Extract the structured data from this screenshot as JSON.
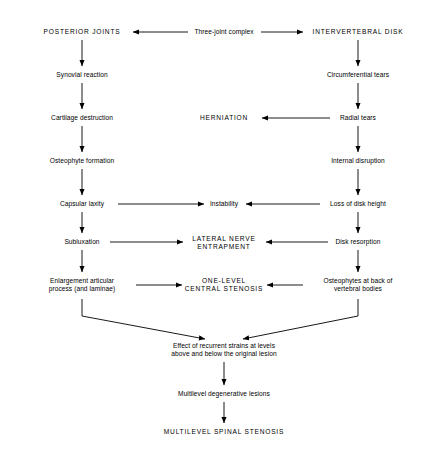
{
  "diagram": {
    "type": "flowchart",
    "background_color": "#ffffff",
    "line_color": "#000000",
    "text_color": "#000000",
    "nodes": [
      {
        "id": "posterior_joints",
        "label": "POSTERIOR JOINTS",
        "style": "caps",
        "x": 82,
        "y": 32
      },
      {
        "id": "three_joint_complex",
        "label": "Three-joint complex",
        "style": "tight",
        "x": 224,
        "y": 32
      },
      {
        "id": "intervertebral_disk",
        "label": "INTERVERTEBRAL DISK",
        "style": "caps",
        "x": 358,
        "y": 32
      },
      {
        "id": "synovial_reaction",
        "label": "Synovial reaction",
        "style": "tight",
        "x": 82,
        "y": 75
      },
      {
        "id": "circumferential_tears",
        "label": "Circumferential tears",
        "style": "tight",
        "x": 358,
        "y": 75
      },
      {
        "id": "cartilage_destruction",
        "label": "Cartilage destruction",
        "style": "tight",
        "x": 82,
        "y": 118
      },
      {
        "id": "herniation",
        "label": "HERNIATION",
        "style": "caps",
        "x": 224,
        "y": 118
      },
      {
        "id": "radial_tears",
        "label": "Radial tears",
        "style": "tight",
        "x": 358,
        "y": 118
      },
      {
        "id": "osteophyte_formation",
        "label": "Osteophyte formation",
        "style": "tight",
        "x": 82,
        "y": 161
      },
      {
        "id": "internal_disruption",
        "label": "Internal disruption",
        "style": "tight",
        "x": 358,
        "y": 161
      },
      {
        "id": "capsular_laxity",
        "label": "Capsular laxity",
        "style": "tight",
        "x": 82,
        "y": 204
      },
      {
        "id": "instability",
        "label": "Instability",
        "style": "tight",
        "x": 224,
        "y": 204
      },
      {
        "id": "loss_of_disk_height",
        "label": "Loss of disk height",
        "style": "tight",
        "x": 358,
        "y": 204
      },
      {
        "id": "subluxation",
        "label": "Subluxation",
        "style": "tight",
        "x": 82,
        "y": 242
      },
      {
        "id": "lateral_nerve_entrapment",
        "label": "LATERAL NERVE\nENTRAPMENT",
        "style": "caps",
        "x": 224,
        "y": 243
      },
      {
        "id": "disk_resorption",
        "label": "Disk resorption",
        "style": "tight",
        "x": 358,
        "y": 242
      },
      {
        "id": "enlargement_articular",
        "label": "Enlargement articular\nprocess (and laminae)",
        "style": "tight",
        "x": 82,
        "y": 285
      },
      {
        "id": "one_level_stenosis",
        "label": "ONE-LEVEL\nCENTRAL STENOSIS",
        "style": "caps",
        "x": 224,
        "y": 285
      },
      {
        "id": "osteophytes_back",
        "label": "Osteophytes at back of\nvertebral bodies",
        "style": "tight",
        "x": 358,
        "y": 285
      },
      {
        "id": "effect_recurrent_strains",
        "label": "Effect of recurrent strains at levels\nabove and below the original lesion",
        "style": "tight",
        "x": 224,
        "y": 350
      },
      {
        "id": "multilevel_degenerative",
        "label": "Multilevel degenerative lesions",
        "style": "tight",
        "x": 224,
        "y": 394
      },
      {
        "id": "multilevel_stenosis",
        "label": "MULTILEVEL SPINAL STENOSIS",
        "style": "caps",
        "x": 224,
        "y": 432
      }
    ],
    "edges": [
      {
        "from": "three_joint_complex",
        "to": "posterior_joints",
        "direction": "left"
      },
      {
        "from": "three_joint_complex",
        "to": "intervertebral_disk",
        "direction": "right"
      },
      {
        "from": "posterior_joints",
        "to": "synovial_reaction",
        "direction": "down"
      },
      {
        "from": "synovial_reaction",
        "to": "cartilage_destruction",
        "direction": "down"
      },
      {
        "from": "cartilage_destruction",
        "to": "osteophyte_formation",
        "direction": "down"
      },
      {
        "from": "osteophyte_formation",
        "to": "capsular_laxity",
        "direction": "down"
      },
      {
        "from": "capsular_laxity",
        "to": "subluxation",
        "direction": "down"
      },
      {
        "from": "subluxation",
        "to": "enlargement_articular",
        "direction": "down"
      },
      {
        "from": "intervertebral_disk",
        "to": "circumferential_tears",
        "direction": "down"
      },
      {
        "from": "circumferential_tears",
        "to": "radial_tears",
        "direction": "down"
      },
      {
        "from": "radial_tears",
        "to": "internal_disruption",
        "direction": "down"
      },
      {
        "from": "internal_disruption",
        "to": "loss_of_disk_height",
        "direction": "down"
      },
      {
        "from": "loss_of_disk_height",
        "to": "disk_resorption",
        "direction": "down"
      },
      {
        "from": "disk_resorption",
        "to": "osteophytes_back",
        "direction": "down"
      },
      {
        "from": "radial_tears",
        "to": "herniation",
        "direction": "left"
      },
      {
        "from": "capsular_laxity",
        "to": "instability",
        "direction": "right"
      },
      {
        "from": "loss_of_disk_height",
        "to": "instability",
        "direction": "left"
      },
      {
        "from": "subluxation",
        "to": "lateral_nerve_entrapment",
        "direction": "right"
      },
      {
        "from": "disk_resorption",
        "to": "lateral_nerve_entrapment",
        "direction": "left"
      },
      {
        "from": "enlargement_articular",
        "to": "one_level_stenosis",
        "direction": "right"
      },
      {
        "from": "osteophytes_back",
        "to": "one_level_stenosis",
        "direction": "left"
      },
      {
        "from": "enlargement_articular",
        "to": "effect_recurrent_strains",
        "direction": "diagonal-down-right"
      },
      {
        "from": "osteophytes_back",
        "to": "effect_recurrent_strains",
        "direction": "diagonal-down-left"
      },
      {
        "from": "effect_recurrent_strains",
        "to": "multilevel_degenerative",
        "direction": "down"
      },
      {
        "from": "multilevel_degenerative",
        "to": "multilevel_stenosis",
        "direction": "down"
      }
    ]
  }
}
